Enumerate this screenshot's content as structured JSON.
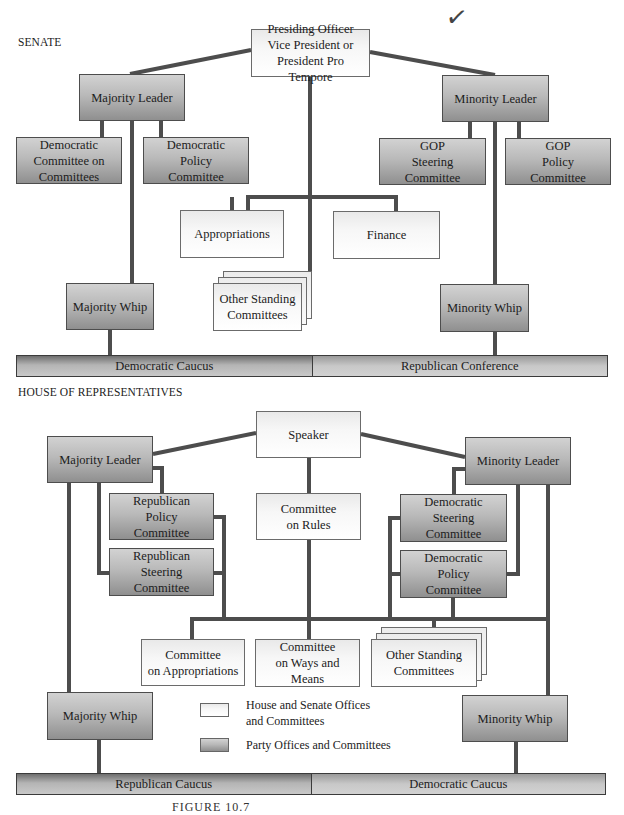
{
  "annotation": {
    "checkmark": "✓"
  },
  "senate": {
    "label": "SENATE",
    "presiding_officer": {
      "line1": "Presiding Officer",
      "line2": "Vice President or",
      "line3": "President Pro Tempore"
    },
    "majority_leader": "Majority Leader",
    "minority_leader": "Minority Leader",
    "dem_committee_on_committees": {
      "line1": "Democratic",
      "line2": "Committee on",
      "line3": "Committees"
    },
    "dem_policy_committee": {
      "line1": "Democratic",
      "line2": "Policy",
      "line3": "Committee"
    },
    "gop_steering_committee": {
      "line1": "GOP",
      "line2": "Steering",
      "line3": "Committee"
    },
    "gop_policy_committee": {
      "line1": "GOP",
      "line2": "Policy",
      "line3": "Committee"
    },
    "appropriations": "Appropriations",
    "finance": "Finance",
    "other_standing": {
      "line1": "Other Standing",
      "line2": "Committees"
    },
    "majority_whip": "Majority Whip",
    "minority_whip": "Minority Whip",
    "caucus_left": "Democratic Caucus",
    "caucus_right": "Republican Conference"
  },
  "house": {
    "label": "HOUSE OF REPRESENTATIVES",
    "speaker": "Speaker",
    "majority_leader": "Majority Leader",
    "minority_leader": "Minority Leader",
    "rep_policy_committee": {
      "line1": "Republican",
      "line2": "Policy",
      "line3": "Committee"
    },
    "rep_steering_committee": {
      "line1": "Republican",
      "line2": "Steering",
      "line3": "Committee"
    },
    "committee_on_rules": {
      "line1": "Committee",
      "line2": "on Rules"
    },
    "dem_steering_committee": {
      "line1": "Democratic",
      "line2": "Steering",
      "line3": "Committee"
    },
    "dem_policy_committee": {
      "line1": "Democratic",
      "line2": "Policy",
      "line3": "Committee"
    },
    "committee_on_appropriations": {
      "line1": "Committee",
      "line2": "on Appropriations"
    },
    "committee_on_ways_and_means": {
      "line1": "Committee",
      "line2": "on Ways and",
      "line3": "Means"
    },
    "other_standing": {
      "line1": "Other Standing",
      "line2": "Committees"
    },
    "majority_whip": "Majority Whip",
    "minority_whip": "Minority Whip",
    "caucus_left": "Republican Caucus",
    "caucus_right": "Democratic Caucus"
  },
  "legend": {
    "light": {
      "line1": "House and Senate Offices",
      "line2": "and Committees"
    },
    "dark": "Party Offices and Committees"
  },
  "caption": "FIGURE 10.7",
  "colors": {
    "connector": "#4a4a4a",
    "light_box": "#f3f3f3",
    "dark_box": "#a9a9a9",
    "border": "#555555"
  }
}
